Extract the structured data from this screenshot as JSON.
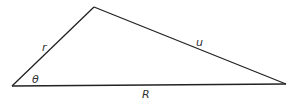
{
  "diagram": {
    "type": "triangle",
    "stroke_color": "#222222",
    "vertices": {
      "left": [
        12,
        86
      ],
      "top": [
        94,
        7
      ],
      "right": [
        286,
        84
      ]
    },
    "labels": {
      "theta": "θ",
      "r": "r",
      "u": "u",
      "R": "R"
    },
    "sides": [
      {
        "from": "left",
        "to": "top",
        "label": "r"
      },
      {
        "from": "top",
        "to": "right",
        "label": "u"
      },
      {
        "from": "left",
        "to": "right",
        "label": "R"
      }
    ],
    "angle": {
      "vertex": "left",
      "label": "θ"
    }
  }
}
